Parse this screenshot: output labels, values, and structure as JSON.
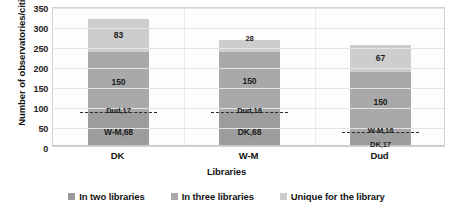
{
  "chart_data": {
    "type": "bar",
    "subtype": "stacked-bar",
    "title": "",
    "xlabel": "Libraries",
    "ylabel": "Number of observatories/cities",
    "categories": [
      "DK",
      "W-M",
      "Dud"
    ],
    "ylim": [
      0,
      350
    ],
    "yticks": [
      0,
      50,
      100,
      150,
      200,
      250,
      300,
      350
    ],
    "ytick_labels": [
      "0",
      "50",
      "100",
      "150",
      "200",
      "250",
      "300",
      "350"
    ],
    "grid": true,
    "legend_position": "bottom",
    "series": [
      {
        "name": "In two libraries",
        "color": "#9a9a9a",
        "values": [
          85,
          86,
          35
        ],
        "segments": [
          {
            "category": "DK",
            "parts": [
              {
                "label": "W-M,68",
                "value": 68
              },
              {
                "label": "Dud,17",
                "value": 17
              }
            ]
          },
          {
            "category": "W-M",
            "parts": [
              {
                "label": "DK,68",
                "value": 68
              },
              {
                "label": "Dud,18",
                "value": 18
              }
            ]
          },
          {
            "category": "Dud",
            "parts": [
              {
                "label": "DK,17",
                "value": 17
              },
              {
                "label": "W-M,18",
                "value": 18
              }
            ]
          }
        ]
      },
      {
        "name": "In three libraries",
        "color": "#a8a8a8",
        "values": [
          150,
          150,
          150
        ],
        "labels": [
          "150",
          "150",
          "150"
        ]
      },
      {
        "name": "Unique for the library",
        "color": "#cccccc",
        "values": [
          83,
          28,
          67
        ],
        "labels": [
          "83",
          "28",
          "67"
        ]
      }
    ],
    "totals": [
      318,
      264,
      252
    ],
    "annotations": [
      "DK: W-M,68 / Dud,17 / 150 / 83",
      "W-M: DK,68 / Dud,18 / 150 / 28",
      "Dud: DK,17 / W-M,18 / 150 / 67"
    ]
  },
  "axis": {
    "y_title": "Number of observatories/cities",
    "x_title": "Libraries",
    "y_ticks": [
      "350",
      "300",
      "250",
      "200",
      "150",
      "100",
      "50",
      "0"
    ],
    "x_ticks": [
      "DK",
      "W-M",
      "Dud"
    ]
  },
  "legend": {
    "items": [
      {
        "label": "In two libraries",
        "color": "#9a9a9a"
      },
      {
        "label": "In three libraries",
        "color": "#a8a8a8"
      },
      {
        "label": "Unique for the library",
        "color": "#cccccc"
      }
    ]
  },
  "bars": [
    {
      "category": "DK",
      "segments": [
        {
          "name": "two-a",
          "label": "W-M,68",
          "value": 68,
          "color": "#9d9d9d"
        },
        {
          "name": "two-b",
          "label": "Dud,17",
          "value": 17,
          "color": "#9d9d9d"
        },
        {
          "name": "three",
          "label": "150",
          "value": 150,
          "color": "#a9a9a9"
        },
        {
          "name": "unique",
          "label": "83",
          "value": 83,
          "color": "#cdcdcd"
        }
      ]
    },
    {
      "category": "W-M",
      "segments": [
        {
          "name": "two-a",
          "label": "DK,68",
          "value": 68,
          "color": "#9d9d9d"
        },
        {
          "name": "two-b",
          "label": "Dud,18",
          "value": 18,
          "color": "#9d9d9d"
        },
        {
          "name": "three",
          "label": "150",
          "value": 150,
          "color": "#a9a9a9"
        },
        {
          "name": "unique",
          "label": "28",
          "value": 28,
          "color": "#cdcdcd"
        }
      ]
    },
    {
      "category": "Dud",
      "segments": [
        {
          "name": "two-a",
          "label": "DK,17",
          "value": 17,
          "color": "#9d9d9d"
        },
        {
          "name": "two-b",
          "label": "W-M,18",
          "value": 18,
          "color": "#9d9d9d"
        },
        {
          "name": "three",
          "label": "150",
          "value": 150,
          "color": "#a9a9a9"
        },
        {
          "name": "unique",
          "label": "67",
          "value": 67,
          "color": "#cdcdcd"
        }
      ]
    }
  ]
}
